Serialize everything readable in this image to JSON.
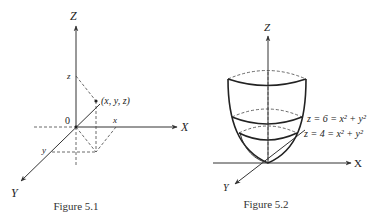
{
  "figure1": {
    "caption": "Figure 5.1",
    "axes": {
      "z": "Z",
      "x": "X",
      "y": "Y"
    },
    "origin_label": "0",
    "point_label": "(x, y, z)",
    "tick_labels": {
      "z": "z",
      "x": "x",
      "y": "y"
    }
  },
  "figure2": {
    "caption": "Figure 5.2",
    "axes": {
      "z": "Z",
      "x": "X",
      "y": "Y"
    },
    "level_curves": [
      {
        "label": "z = 6 = x² + y²"
      },
      {
        "label": "z = 4 = x² + y²"
      }
    ]
  }
}
